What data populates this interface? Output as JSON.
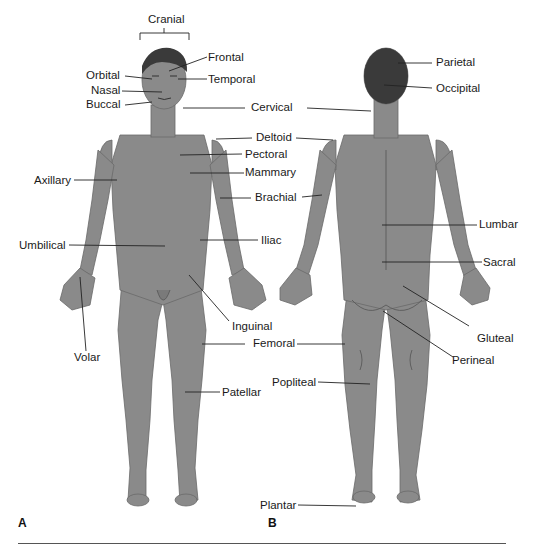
{
  "figure": {
    "panels": [
      {
        "id": "A",
        "label": "A",
        "view": "anterior"
      },
      {
        "id": "B",
        "label": "B",
        "view": "posterior"
      }
    ],
    "colors": {
      "skin": "#8a8a8a",
      "skin_shadow": "#6f6f6f",
      "hair": "#3a3a3a",
      "leader_line": "#222222",
      "text": "#1a1a1a",
      "background": "#ffffff"
    },
    "anterior_labels": [
      {
        "key": "cranial",
        "text": "Cranial"
      },
      {
        "key": "frontal",
        "text": "Frontal"
      },
      {
        "key": "orbital",
        "text": "Orbital"
      },
      {
        "key": "temporal",
        "text": "Temporal"
      },
      {
        "key": "nasal",
        "text": "Nasal"
      },
      {
        "key": "buccal",
        "text": "Buccal"
      },
      {
        "key": "cervical",
        "text": "Cervical"
      },
      {
        "key": "deltoid",
        "text": "Deltoid"
      },
      {
        "key": "pectoral",
        "text": "Pectoral"
      },
      {
        "key": "axillary",
        "text": "Axillary"
      },
      {
        "key": "mammary",
        "text": "Mammary"
      },
      {
        "key": "brachial",
        "text": "Brachial"
      },
      {
        "key": "umbilical",
        "text": "Umbilical"
      },
      {
        "key": "iliac",
        "text": "Iliac"
      },
      {
        "key": "inguinal",
        "text": "Inguinal"
      },
      {
        "key": "volar",
        "text": "Volar"
      },
      {
        "key": "femoral",
        "text": "Femoral"
      },
      {
        "key": "patellar",
        "text": "Patellar"
      }
    ],
    "posterior_labels": [
      {
        "key": "parietal",
        "text": "Parietal"
      },
      {
        "key": "occipital",
        "text": "Occipital"
      },
      {
        "key": "lumbar",
        "text": "Lumbar"
      },
      {
        "key": "sacral",
        "text": "Sacral"
      },
      {
        "key": "gluteal",
        "text": "Gluteal"
      },
      {
        "key": "perineal",
        "text": "Perineal"
      },
      {
        "key": "popliteal",
        "text": "Popliteal"
      },
      {
        "key": "plantar",
        "text": "Plantar"
      }
    ]
  }
}
